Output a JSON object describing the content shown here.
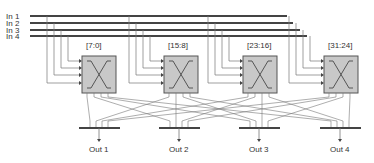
{
  "diagram": {
    "inputs": [
      {
        "label": "In 1",
        "y": 16,
        "end_x": 287
      },
      {
        "label": "In 2",
        "y": 23,
        "end_x": 293
      },
      {
        "label": "In 3",
        "y": 30,
        "end_x": 300
      },
      {
        "label": "In 4",
        "y": 36,
        "end_x": 307
      }
    ],
    "crossbars": [
      {
        "label": "[7:0]",
        "x": 82,
        "w": 34
      },
      {
        "label": "[15:8]",
        "x": 164,
        "w": 34
      },
      {
        "label": "[23:16]",
        "x": 243,
        "w": 34
      },
      {
        "label": "[31:24]",
        "x": 324,
        "w": 34
      }
    ],
    "outputs": [
      {
        "label": "Out 1",
        "x": 99
      },
      {
        "label": "Out 2",
        "x": 179
      },
      {
        "label": "Out 3",
        "x": 259
      },
      {
        "label": "Out 4",
        "x": 340
      }
    ],
    "colors": {
      "line": "#444444",
      "thin": "#777777",
      "box_fill": "#c8c8c8",
      "box_stroke": "#555555",
      "text": "#333333"
    }
  }
}
